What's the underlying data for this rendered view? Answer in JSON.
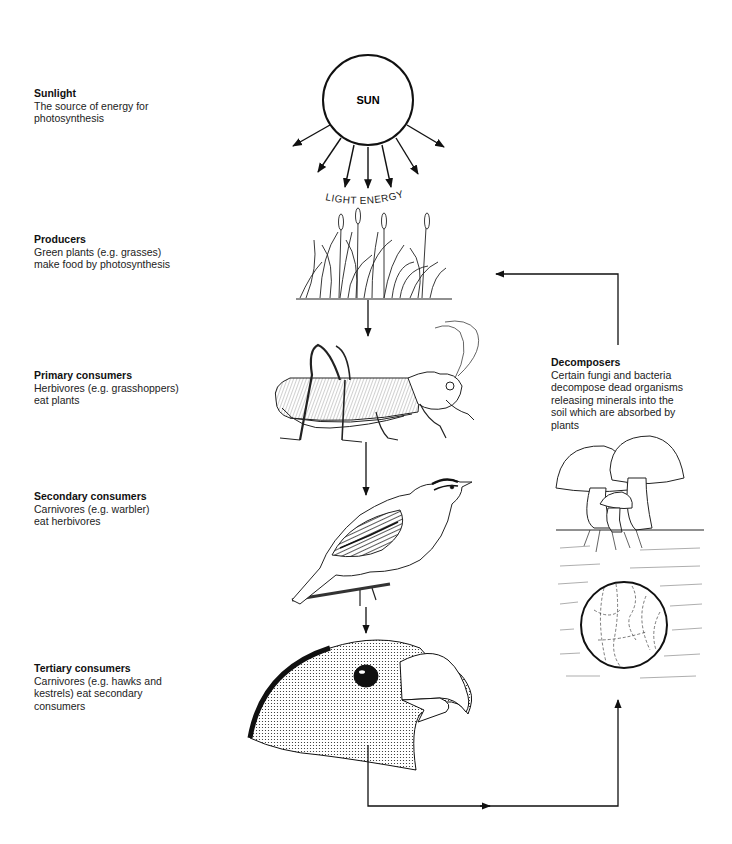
{
  "levels": [
    {
      "id": "sunlight",
      "title": "Sunlight",
      "description": "The source of energy for\nphotosynthesis"
    },
    {
      "id": "producers",
      "title": "Producers",
      "description": "Green plants (e.g. grasses)\nmake food by photosynthesis"
    },
    {
      "id": "primary",
      "title": "Primary consumers",
      "description": "Herbivores (e.g. grasshoppers)\neat plants"
    },
    {
      "id": "secondary",
      "title": "Secondary consumers",
      "description": "Carnivores (e.g. warbler)\neat herbivores"
    },
    {
      "id": "tertiary",
      "title": "Tertiary consumers",
      "description": "Carnivores (e.g. hawks and\nkestrels) eat secondary\nconsumers"
    },
    {
      "id": "decomposers",
      "title": "Decomposers",
      "description": "Certain fungi and bacteria\ndecompose dead organisms\nreleasing minerals into the\nsoil which are absorbed by\nplants"
    }
  ],
  "sun": {
    "label": "SUN",
    "light_label": "LIGHT ENERGY"
  },
  "illustrations": {
    "producer": "grass",
    "primary": "grasshopper",
    "secondary": "warbler",
    "tertiary": "hawk-head",
    "decomposer": "mushrooms-and-soil-bacteria"
  },
  "flow": [
    "sun",
    "grass",
    "grasshopper",
    "warbler",
    "hawk",
    "decomposers",
    "grass"
  ]
}
